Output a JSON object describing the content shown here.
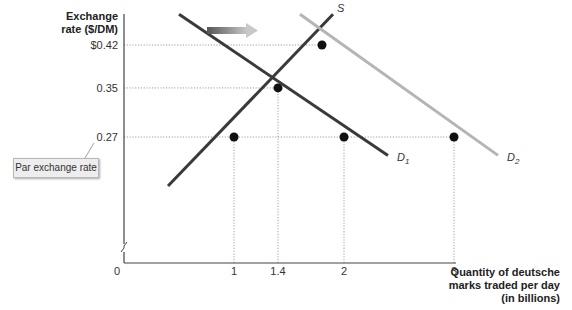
{
  "chart_data": {
    "type": "line",
    "title": "",
    "ylabel": "Exchange rate ($/DM)",
    "xlabel": "Quantity of deutsche marks traded per day (in billions)",
    "xlabel_lines": [
      "Quantity of deutsche",
      "marks traded per day",
      "(in billions)"
    ],
    "ylabel_lines": [
      "Exchange",
      "rate ($/DM)"
    ],
    "origin_label": "0",
    "x_ticks": [
      {
        "value": 1,
        "label": "1"
      },
      {
        "value": 1.4,
        "label": "1.4"
      },
      {
        "value": 2,
        "label": "2"
      },
      {
        "value": 3,
        "label": "3"
      }
    ],
    "y_ticks": [
      {
        "value": 0.42,
        "label": "$0.42"
      },
      {
        "value": 0.35,
        "label": "0.35"
      },
      {
        "value": 0.27,
        "label": "0.27"
      }
    ],
    "series": [
      {
        "name": "S",
        "label": "S",
        "subscript": "",
        "color": "#3a3a3a",
        "points": [
          [
            0.4,
            0.19
          ],
          [
            1.9,
            0.47
          ]
        ]
      },
      {
        "name": "D1",
        "label": "D",
        "subscript": "1",
        "color": "#3a3a3a",
        "points": [
          [
            0.5,
            0.47
          ],
          [
            2.4,
            0.24
          ]
        ]
      },
      {
        "name": "D2",
        "label": "D",
        "subscript": "2",
        "color": "#b5b5b5",
        "points": [
          [
            1.6,
            0.47
          ],
          [
            3.4,
            0.24
          ]
        ]
      }
    ],
    "points": [
      {
        "x": 1.8,
        "y": 0.42
      },
      {
        "x": 1.4,
        "y": 0.35
      },
      {
        "x": 1,
        "y": 0.27
      },
      {
        "x": 2,
        "y": 0.27
      },
      {
        "x": 3,
        "y": 0.27
      }
    ],
    "guides": [
      {
        "y": 0.42,
        "x_to": 1.8
      },
      {
        "y": 0.35,
        "x_to": 1.4
      },
      {
        "y": 0.27,
        "x_to": 3
      },
      {
        "x": 1,
        "y_to": 0.27
      },
      {
        "x": 1.4,
        "y_to": 0.35
      },
      {
        "x": 2,
        "y_to": 0.27
      },
      {
        "x": 3,
        "y_to": 0.27
      }
    ],
    "annotations": [
      {
        "text": "Par exchange rate",
        "points_to_y": 0.27
      },
      {
        "text": "shift-arrow",
        "meaning": "demand shifts right from D1 to D2"
      }
    ],
    "axis_break": true,
    "grid": false,
    "legend": "none"
  }
}
